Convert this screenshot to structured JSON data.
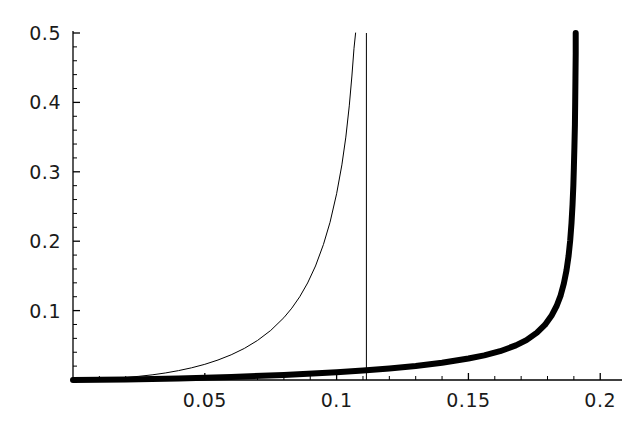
{
  "chart_data": {
    "type": "line",
    "title": "",
    "subtitle": "",
    "xlabel": "",
    "ylabel": "",
    "xlim": [
      0,
      0.2075
    ],
    "ylim": [
      0,
      0.5
    ],
    "grid": false,
    "legend": null,
    "background_color": "#ffffff",
    "foreground_color": "#000000",
    "x_ticks": [
      {
        "value": 0.05,
        "label": "0.05"
      },
      {
        "value": 0.1,
        "label": "0.1"
      },
      {
        "value": 0.15,
        "label": "0.15"
      },
      {
        "value": 0.2,
        "label": "0.2"
      }
    ],
    "y_ticks": [
      {
        "value": 0.1,
        "label": "0.1"
      },
      {
        "value": 0.2,
        "label": "0.2"
      },
      {
        "value": 0.3,
        "label": "0.3"
      },
      {
        "value": 0.4,
        "label": "0.4"
      },
      {
        "value": 0.5,
        "label": "0.5"
      }
    ],
    "x_minor_tick_step": 0.01,
    "y_minor_tick_step": 0.02,
    "series": [
      {
        "name": "thin-curve",
        "style": "thin",
        "line_width": 1,
        "color": "#000000",
        "asymptote_x": 0.1083,
        "points": [
          [
            0.0,
            0.0
          ],
          [
            0.01,
            0.0013
          ],
          [
            0.02,
            0.0036
          ],
          [
            0.025,
            0.0053
          ],
          [
            0.03,
            0.0074
          ],
          [
            0.035,
            0.0101
          ],
          [
            0.04,
            0.0135
          ],
          [
            0.045,
            0.0176
          ],
          [
            0.05,
            0.0226
          ],
          [
            0.055,
            0.0288
          ],
          [
            0.06,
            0.0363
          ],
          [
            0.065,
            0.0455
          ],
          [
            0.07,
            0.057
          ],
          [
            0.075,
            0.0714
          ],
          [
            0.08,
            0.0898
          ],
          [
            0.083,
            0.1035
          ],
          [
            0.086,
            0.1199
          ],
          [
            0.089,
            0.1398
          ],
          [
            0.092,
            0.1643
          ],
          [
            0.095,
            0.1952
          ],
          [
            0.0975,
            0.2272
          ],
          [
            0.1,
            0.2684
          ],
          [
            0.102,
            0.31
          ],
          [
            0.1035,
            0.35
          ],
          [
            0.1048,
            0.395
          ],
          [
            0.1058,
            0.438
          ],
          [
            0.1066,
            0.478
          ],
          [
            0.1072,
            0.5
          ]
        ]
      },
      {
        "name": "vertical-asymptote-line",
        "style": "thin",
        "line_width": 1,
        "color": "#000000",
        "x_value": 0.1113,
        "y_from": 0.0,
        "y_to": 0.5
      },
      {
        "name": "thick-curve",
        "style": "thick",
        "line_width": 6,
        "color": "#000000",
        "asymptote_x": 0.1905,
        "points": [
          [
            0.0,
            0.0
          ],
          [
            0.02,
            0.0008
          ],
          [
            0.04,
            0.0023
          ],
          [
            0.06,
            0.0044
          ],
          [
            0.08,
            0.0073
          ],
          [
            0.1,
            0.0112
          ],
          [
            0.11,
            0.0137
          ],
          [
            0.12,
            0.0167
          ],
          [
            0.13,
            0.0203
          ],
          [
            0.14,
            0.0249
          ],
          [
            0.15,
            0.0309
          ],
          [
            0.156,
            0.0355
          ],
          [
            0.162,
            0.0415
          ],
          [
            0.168,
            0.0498
          ],
          [
            0.172,
            0.0575
          ],
          [
            0.176,
            0.0682
          ],
          [
            0.179,
            0.0793
          ],
          [
            0.1815,
            0.0925
          ],
          [
            0.1835,
            0.107
          ],
          [
            0.185,
            0.122
          ],
          [
            0.1862,
            0.139
          ],
          [
            0.1872,
            0.158
          ],
          [
            0.188,
            0.179
          ],
          [
            0.1886,
            0.201
          ],
          [
            0.1891,
            0.226
          ],
          [
            0.1895,
            0.253
          ],
          [
            0.1898,
            0.28
          ],
          [
            0.19,
            0.306
          ],
          [
            0.1902,
            0.335
          ],
          [
            0.1904,
            0.368
          ],
          [
            0.1905,
            0.4
          ],
          [
            0.1906,
            0.435
          ],
          [
            0.1907,
            0.47
          ],
          [
            0.1907,
            0.5
          ]
        ]
      }
    ]
  },
  "axes": {
    "x_axis_name": "x-axis-line",
    "y_axis_name": "y-axis-line"
  }
}
